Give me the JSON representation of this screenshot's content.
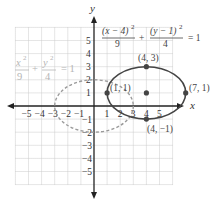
{
  "figure": {
    "axes": {
      "x_label": "x",
      "y_label": "y",
      "x_range": [
        -6,
        6
      ],
      "y_range": [
        -6,
        6
      ],
      "grid": true,
      "x_ticks": [
        "-5",
        "-4",
        "-3",
        "-2",
        "-1",
        "1",
        "2",
        "3",
        "4",
        "5"
      ],
      "y_ticks": [
        "5",
        "4",
        "3",
        "2",
        "1",
        "-1",
        "-2",
        "-3",
        "-4",
        "-5"
      ]
    },
    "shifted_ellipse": {
      "equation": {
        "num1": "(x − 4)",
        "exp1": "2",
        "den1": "9",
        "plus": "+",
        "num2": "(y − 1)",
        "exp2": "2",
        "den2": "4",
        "eq": "= 1"
      },
      "center": [
        4,
        1
      ],
      "a": 3,
      "b": 2,
      "style": "solid",
      "color": "#444444",
      "points": [
        {
          "label": "(4, 3)",
          "x": 4,
          "y": 3
        },
        {
          "label": "(1, 1)",
          "x": 1,
          "y": 1
        },
        {
          "label": "(7, 1)",
          "x": 7,
          "y": 1
        },
        {
          "label": "(4, −1)",
          "x": 4,
          "y": -1
        },
        {
          "label": "",
          "x": 4,
          "y": 1
        }
      ]
    },
    "original_ellipse": {
      "equation": {
        "num1": "x",
        "exp1": "2",
        "den1": "9",
        "plus": "+",
        "num2": "y",
        "exp2": "2",
        "den2": "4",
        "eq": "= 1"
      },
      "center": [
        0,
        0
      ],
      "a": 3,
      "b": 2,
      "style": "dashed",
      "color": "#9a9a9a"
    }
  },
  "chart_data": {
    "type": "scatter",
    "title": "",
    "xlabel": "x",
    "ylabel": "y",
    "xlim": [
      -6,
      6
    ],
    "ylim": [
      -6,
      6
    ],
    "grid": true,
    "x_ticks": [
      -5,
      -4,
      -3,
      -2,
      -1,
      1,
      2,
      3,
      4,
      5
    ],
    "y_ticks": [
      -5,
      -4,
      -3,
      -2,
      -1,
      1,
      2,
      3,
      4,
      5
    ],
    "series": [
      {
        "name": "(x − 4)²/9 + (y − 1)²/4 = 1",
        "shape": "ellipse",
        "center": [
          4,
          1
        ],
        "semi_axes": [
          3,
          2
        ],
        "style": "solid",
        "labeled_points": [
          {
            "label": "(4, 3)",
            "x": 4,
            "y": 3
          },
          {
            "label": "(1, 1)",
            "x": 1,
            "y": 1
          },
          {
            "label": "(7, 1)",
            "x": 7,
            "y": 1
          },
          {
            "label": "(4, −1)",
            "x": 4,
            "y": -1
          }
        ],
        "center_point": [
          4,
          1
        ]
      },
      {
        "name": "x²/9 + y²/4 = 1",
        "shape": "ellipse",
        "center": [
          0,
          0
        ],
        "semi_axes": [
          3,
          2
        ],
        "style": "dashed"
      }
    ]
  }
}
